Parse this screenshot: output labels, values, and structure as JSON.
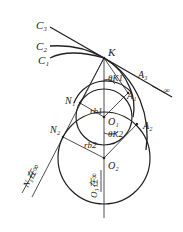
{
  "diagram": {
    "title": "",
    "labels": {
      "C3": "C₃",
      "C2": "C₂",
      "C1": "C₁",
      "K": "K",
      "A3": "A₃",
      "inf_A3": "∞",
      "thetaK1": "θK1",
      "A1": "A₁",
      "N1": "N₁",
      "rb1": "rb1",
      "O1": "O₁",
      "A2": "A₂",
      "N2": "N₂",
      "thetaK2": "θK2",
      "rb2": "rb2",
      "O2": "O₂",
      "N3_inf": "N₃在∞",
      "O3_inf": "O₃在∞"
    },
    "colors": {
      "line": "#222222",
      "background": "#ffffff"
    }
  }
}
